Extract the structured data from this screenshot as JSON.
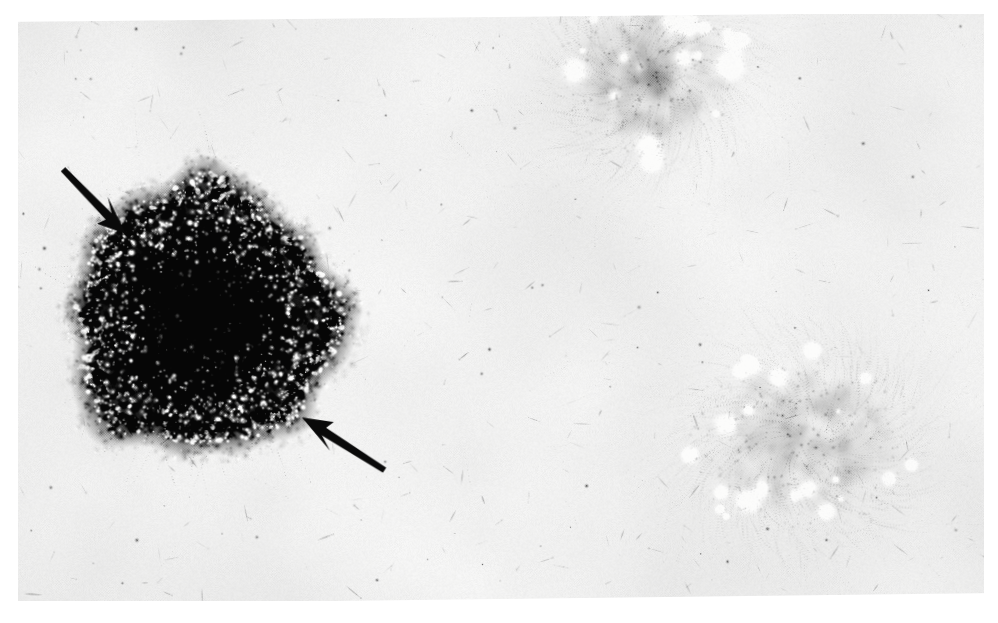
{
  "figure": {
    "kind": "photomicrograph",
    "modality": "light-microscopy",
    "staining": "grayscale halftone print",
    "title": "",
    "caption": "",
    "label": "",
    "background_color": "#f2f1ee",
    "paper_white": "#ffffff",
    "ink_black": "#000000",
    "width": 998,
    "height": 623
  },
  "plate": {
    "rotation_deg": -1.1,
    "margin_left": 18,
    "margin_top": 14,
    "margin_right": 14,
    "margin_bottom": 22,
    "tone_base": "#f1f0ec",
    "halftone_dot_pitch": 2.6,
    "halftone_strength": 0.1,
    "vignette_strength": 0.06
  },
  "objects": [
    {
      "name": "epithelial-colony",
      "type": "dense-round-colony",
      "cx": 200,
      "cy": 316,
      "rx": 130,
      "ry": 133,
      "core_rx": 74,
      "core_ry": 78,
      "core_darkness": 0.96,
      "rim_darkness": 0.72,
      "speckle_count": 1500,
      "speckle_bright": "#f4f3ef",
      "edge_roughness": 0.3,
      "description": "densely packed dark cobblestone epithelial colony with bright cellular speckles"
    },
    {
      "name": "fibroblast-cluster-upper-right",
      "type": "radiating-spindle-cluster",
      "cx": 648,
      "cy": 104,
      "rx": 182,
      "ry": 150,
      "core_cx": 652,
      "core_cy": 80,
      "core_rx": 78,
      "core_ry": 72,
      "fiber_count": 880,
      "darkness": 0.62,
      "swirl": 1.25,
      "description": "whorled fibroblast-like spindle cells radiating outward from a dark core"
    },
    {
      "name": "fibroblast-cluster-lower-right",
      "type": "radiating-spindle-cluster",
      "cx": 796,
      "cy": 448,
      "rx": 210,
      "ry": 172,
      "core_cx": 800,
      "core_cy": 452,
      "core_rx": 96,
      "core_ry": 80,
      "fiber_count": 1020,
      "darkness": 0.66,
      "swirl": -1.15,
      "description": "large whorled fibroblast-like spindle cell cluster with streaming outgrowth"
    },
    {
      "name": "scattered-spindle-cells",
      "type": "sparse-cell-field",
      "count": 330,
      "darkness": 0.33,
      "description": "isolated elongated spindle cells and debris scattered over the pale background"
    }
  ],
  "annotations": {
    "arrow_color": "#0a0a0a",
    "arrows": [
      {
        "name": "arrow-upper-left",
        "tail_x": 62,
        "tail_y": 163,
        "tip_x": 124,
        "tip_y": 230,
        "shaft_width": 9,
        "head_length": 40,
        "head_width": 26,
        "points_at": "epithelial-colony upper-left margin"
      },
      {
        "name": "arrow-lower-right",
        "tail_x": 379,
        "tail_y": 474,
        "tip_x": 297,
        "tip_y": 419,
        "shaft_width": 9,
        "head_length": 42,
        "head_width": 26,
        "points_at": "epithelial-colony lower-right margin"
      }
    ]
  }
}
